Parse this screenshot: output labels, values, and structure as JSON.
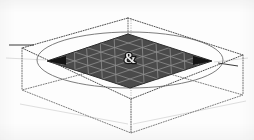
{
  "figure": {
    "title": "3D isometric grid surface inside dotted wireframe box",
    "background_color": "#fdfdfd",
    "bounding_box": {
      "width": 254,
      "height": 140
    },
    "elements": {
      "wireframe_box": {
        "name": "dotted-wireframe-box",
        "stroke_color": "#5a5a5a",
        "stroke_style": "dotted",
        "stroke_width": 0.9,
        "top_face": {
          "label": "top-face",
          "vertices": [
            {
              "x": 128,
              "y": 18
            },
            {
              "x": 243,
              "y": 55
            },
            {
              "x": 131,
              "y": 99
            },
            {
              "x": 22,
              "y": 48
            }
          ]
        },
        "bottom_face": {
          "label": "bottom-face",
          "vertices": [
            {
              "x": 128,
              "y": 62
            },
            {
              "x": 243,
              "y": 95
            },
            {
              "x": 131,
              "y": 133
            },
            {
              "x": 22,
              "y": 90
            }
          ]
        },
        "vertical_edges": [
          {
            "label": "edge-top-vertex",
            "x1": 128,
            "y1": 18,
            "x2": 128,
            "y2": 62
          },
          {
            "label": "edge-right-vertex",
            "x1": 243,
            "y1": 55,
            "x2": 243,
            "y2": 95
          },
          {
            "label": "edge-front-vertex",
            "x1": 131,
            "y1": 99,
            "x2": 131,
            "y2": 133
          },
          {
            "label": "edge-left-vertex",
            "x1": 22,
            "y1": 48,
            "x2": 22,
            "y2": 90
          }
        ],
        "center_axis": {
          "label": "vertical-center-axis",
          "x1": 131,
          "y1": 18,
          "x2": 131,
          "y2": 133
        }
      },
      "grid_surface": {
        "name": "grid-surface",
        "shape": "rhombus",
        "rows": 6,
        "columns": 6,
        "fill_color": "#4a4a4a",
        "grid_line_color": "#8e8e8e",
        "grid_line_width": 0.8,
        "vertices": [
          {
            "label": "north",
            "x": 128,
            "y": 34
          },
          {
            "label": "east",
            "x": 212,
            "y": 61
          },
          {
            "label": "south",
            "x": 130,
            "y": 88
          },
          {
            "label": "west",
            "x": 47,
            "y": 61
          }
        ]
      },
      "perspective_circle": {
        "name": "perspective-ellipse",
        "stroke_color": "#7d7d7d",
        "stroke_width": 1.0,
        "fill": "none",
        "center": {
          "cx": 130,
          "cy": 60
        },
        "radii": {
          "rx": 93,
          "ry": 28
        }
      },
      "center_marker": {
        "name": "center-marker-glyph",
        "symbol": "&",
        "color": "#e6e6e6",
        "outline_color": "#1c1c1c",
        "position": {
          "x": 130,
          "y": 58
        },
        "size": 13
      },
      "tick_marks": [
        {
          "label": "left-tick",
          "x1": 9,
          "y1": 45,
          "x2": 34,
          "y2": 45
        },
        {
          "label": "right-tick",
          "x1": 218,
          "y1": 63,
          "x2": 238,
          "y2": 66
        }
      ],
      "faint_guides": [
        {
          "label": "guide-lower-left",
          "x1": 20,
          "y1": 104,
          "x2": 128,
          "y2": 124
        },
        {
          "label": "guide-lower-right",
          "x1": 133,
          "y1": 124,
          "x2": 246,
          "y2": 101
        },
        {
          "label": "guide-upper-right",
          "x1": 214,
          "y1": 62,
          "x2": 248,
          "y2": 58
        }
      ]
    }
  }
}
